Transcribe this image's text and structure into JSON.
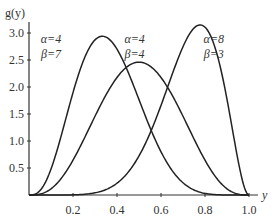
{
  "chart_data": {
    "type": "line",
    "title": "",
    "xlabel": "y",
    "ylabel": "g(y)",
    "xlim": [
      0,
      1.0
    ],
    "ylim": [
      0,
      3.2
    ],
    "x_ticks": [
      "0.2",
      "0.4",
      "0.6",
      "0.8",
      "1.0"
    ],
    "y_ticks": [
      "0.5",
      "1.0",
      "1.5",
      "2.0",
      "2.5",
      "3.0"
    ],
    "grid": false,
    "legend": "inline annotations",
    "series": [
      {
        "name": "α=4 β=7",
        "alpha": 4,
        "beta": 7,
        "peak_x": 0.33,
        "peak_y": 2.94,
        "scale": 1.0
      },
      {
        "name": "α=4 β=4",
        "alpha": 4,
        "beta": 4,
        "peak_x": 0.5,
        "peak_y": 2.46,
        "scale": 1.0
      },
      {
        "name": "α=8 β=3",
        "alpha": 8,
        "beta": 3,
        "peak_x": 0.78,
        "peak_y": 3.15,
        "scale": 1.0
      }
    ],
    "annotations": [
      {
        "line1": "α=4",
        "line2": "β=7",
        "x": 0.1,
        "y": 2.85
      },
      {
        "line1": "α=4",
        "line2": "β=4",
        "x": 0.48,
        "y": 2.85
      },
      {
        "line1": "α=8",
        "line2": "β=3",
        "x": 0.84,
        "y": 2.85
      }
    ]
  }
}
